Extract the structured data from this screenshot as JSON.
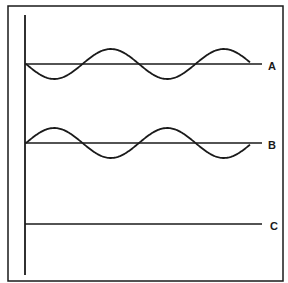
{
  "diagram": {
    "type": "waveform-comparison",
    "frame": {
      "x": 8,
      "y": 6,
      "width": 275,
      "height": 275
    },
    "axis": {
      "x": 25,
      "y_top": 15,
      "y_bottom": 275
    },
    "waves": [
      {
        "label": "A",
        "baseline_y": 64,
        "label_y": 70,
        "start_x": 26,
        "end_x": 250,
        "line_end_x": 262,
        "amplitude": 15,
        "period": 113,
        "initial_direction": "down",
        "type": "sine"
      },
      {
        "label": "B",
        "baseline_y": 143,
        "label_y": 149,
        "start_x": 26,
        "end_x": 250,
        "line_end_x": 262,
        "amplitude": 15,
        "period": 113,
        "initial_direction": "up",
        "type": "sine"
      },
      {
        "label": "C",
        "baseline_y": 224,
        "label_y": 230,
        "start_x": 26,
        "end_x": 262,
        "line_end_x": 262,
        "amplitude": 0,
        "period": 0,
        "initial_direction": "none",
        "type": "flat"
      }
    ],
    "colors": {
      "stroke": "#1a1a1a",
      "background": "#ffffff"
    }
  },
  "labels": {
    "a": "A",
    "b": "B",
    "c": "C"
  }
}
